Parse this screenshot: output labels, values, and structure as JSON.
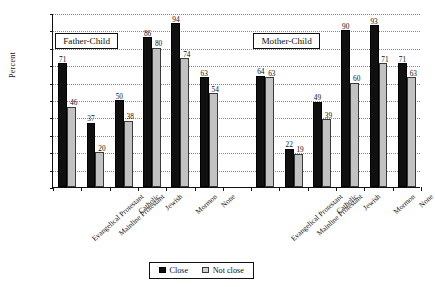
{
  "chart_data": {
    "type": "bar",
    "title": "",
    "xlabel": "",
    "ylabel": "Percent",
    "ylim": [
      0,
      100
    ],
    "ytick_step": 10,
    "yticks": [
      "0",
      "10",
      "20",
      "30",
      "40",
      "50",
      "60",
      "70",
      "80",
      "90",
      "100"
    ],
    "grid": true,
    "legend_position": "bottom",
    "legend": [
      "Close",
      "Not close"
    ],
    "panels": [
      {
        "name": "Father-Child",
        "categories": [
          "Evangelical Protestant",
          "Mainline Protestant",
          "Catholic",
          "Jewish",
          "Mormon",
          "None"
        ],
        "series": [
          {
            "name": "Close",
            "values": [
              71,
              37,
              50,
              86,
              94,
              63
            ]
          },
          {
            "name": "Not close",
            "values": [
              46,
              20,
              38,
              80,
              74,
              54
            ]
          }
        ]
      },
      {
        "name": "Mother-Child",
        "categories": [
          "Evangelical Protestant",
          "Mainline Protestant",
          "Catholic",
          "Jewish",
          "Mormon",
          "None"
        ],
        "series": [
          {
            "name": "Close",
            "values": [
              64,
              22,
              49,
              90,
              93,
              71
            ]
          },
          {
            "name": "Not close",
            "values": [
              63,
              19,
              39,
              60,
              71,
              63
            ]
          }
        ]
      }
    ],
    "colors": {
      "close": "#101010",
      "not_close": "#c2c2c2",
      "axis": "#111111",
      "grid": "#8a8a8a"
    }
  },
  "axis": {
    "y_label": "Percent",
    "y_ticks": [
      "0",
      "10",
      "20",
      "30",
      "40",
      "50",
      "60",
      "70",
      "80",
      "90",
      "100"
    ]
  },
  "panel_titles": {
    "father": "Father-Child",
    "mother": "Mother-Child"
  },
  "legend": {
    "close_label": "Close",
    "not_close_label": "Not close"
  }
}
